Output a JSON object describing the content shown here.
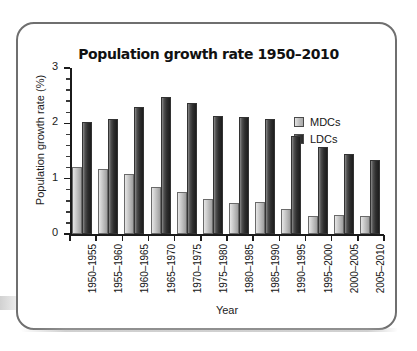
{
  "figure": {
    "frame_border_color": "#6f6f6f",
    "background": "#ffffff"
  },
  "chart_data": {
    "type": "bar",
    "title": "Population growth rate 1950–2010",
    "xlabel": "Year",
    "ylabel": "Population growth rate (%)",
    "ylim": [
      0,
      3
    ],
    "yticks": [
      "0",
      "1",
      "2",
      "3"
    ],
    "grid": false,
    "legend_position": "top-right",
    "categories": [
      "1950–1955",
      "1955–1960",
      "1960–1965",
      "1965–1970",
      "1970–1975",
      "1975–1980",
      "1980–1985",
      "1985–1990",
      "1990–1995",
      "1995–2000",
      "2000–2005",
      "2005–2010"
    ],
    "series": [
      {
        "name": "MDCs",
        "color": "#c6c6c6",
        "values": [
          1.21,
          1.18,
          1.09,
          0.85,
          0.76,
          0.64,
          0.56,
          0.58,
          0.45,
          0.32,
          0.34,
          0.32
        ]
      },
      {
        "name": "LDCs",
        "color": "#2e2e2e",
        "values": [
          2.03,
          2.08,
          2.29,
          2.47,
          2.36,
          2.13,
          2.11,
          2.07,
          1.78,
          1.57,
          1.44,
          1.34
        ]
      }
    ]
  }
}
